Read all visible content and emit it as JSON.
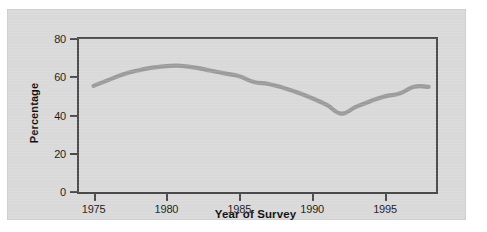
{
  "figure": {
    "panel_background": "#d9d9d9",
    "page_background": "#ffffff",
    "frame_color": "#4a4a4a",
    "series_color": "#9b9b9b"
  },
  "chart_data": {
    "type": "line",
    "title": "",
    "subtitle": "",
    "xlabel": "Year of Survey",
    "ylabel": "Percentage",
    "xlim": [
      1974,
      1998.5
    ],
    "ylim": [
      0,
      80
    ],
    "grid": false,
    "legend": "none",
    "xticks": [
      1975,
      1980,
      1985,
      1990,
      1995
    ],
    "xtick_labels": [
      "1975",
      "1980",
      "1985",
      "1990",
      "1995"
    ],
    "yticks": [
      0,
      20,
      40,
      60,
      80
    ],
    "ytick_labels": [
      "0",
      "20",
      "40",
      "60",
      "80"
    ],
    "series": [
      {
        "name": "Percentage",
        "color": "#9b9b9b",
        "x": [
          1975,
          1976,
          1977,
          1978,
          1979,
          1980,
          1981,
          1982,
          1983,
          1984,
          1985,
          1986,
          1987,
          1988,
          1989,
          1990,
          1991,
          1992,
          1993,
          1994,
          1995,
          1996,
          1997,
          1998
        ],
        "values": [
          55.5,
          58.5,
          61.5,
          63.5,
          65.0,
          65.8,
          66.0,
          65.0,
          63.5,
          62.0,
          60.5,
          57.5,
          56.5,
          54.5,
          52.0,
          49.0,
          45.5,
          41.0,
          44.5,
          47.5,
          50.0,
          51.5,
          55.0,
          55.0
        ]
      }
    ],
    "annotations": []
  }
}
